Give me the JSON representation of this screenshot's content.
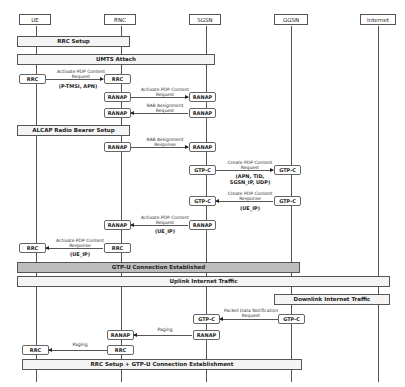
{
  "actors": [
    {
      "name": "UE"
    },
    {
      "name": "RNC"
    },
    {
      "name": "SGSN"
    },
    {
      "name": "GGSN"
    },
    {
      "name": "Internet"
    }
  ],
  "phases": {
    "rrc_setup": "RRC Setup",
    "umts_attach": "UMTS Attach",
    "alcap": "ALCAP Radio Bearer Setup",
    "gtpu_established": "GTP-U Connection Established",
    "uplink": "Uplink Internet Traffic",
    "downlink": "Downlink Internet Traffic",
    "final": "RRC Setup + GTP-U Connection Establishment"
  },
  "nodes": {
    "rrc": "RRC",
    "ranap": "RANAP",
    "gtpc": "GTP-C"
  },
  "messages": {
    "m1": {
      "label": "Activate PDP Content\nRequest",
      "params": "(P-TMSI, APN)"
    },
    "m2": {
      "label": "Activate PDP Content\nRequest"
    },
    "m3": {
      "label": "RAB Assignment\nRequest"
    },
    "m4": {
      "label": "RAB Assignment\nResponse"
    },
    "m5": {
      "label": "Create PDP Content\nRequest",
      "params": "(APN, TID,\nSGSN_IP, UDP)"
    },
    "m6": {
      "label": "Create PDP Content\nResponse",
      "params": "(UE_IP)"
    },
    "m7": {
      "label": "Activate PDP Content\nRequest",
      "params": "(UE_IP)"
    },
    "m8": {
      "label": "Activate PDP Content\nResponse",
      "params": "(UE_IP)"
    },
    "m9": {
      "label": "Packet Data Notification\nRequest"
    },
    "m10": {
      "label": "Paging"
    },
    "m11": {
      "label": "Paging"
    }
  }
}
